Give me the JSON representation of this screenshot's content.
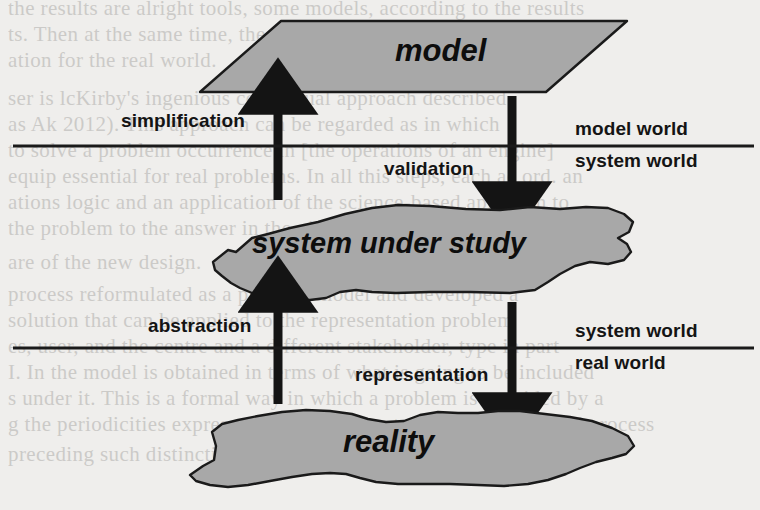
{
  "figure": {
    "kind": "conceptual-diagram",
    "background_color": "#efeeec",
    "shape_fill_color": "#a8a8a8",
    "shape_stroke_color": "#1a1a1a",
    "line_color": "#1a1a1a"
  },
  "shapes": {
    "model": {
      "label": "model",
      "form": "parallelogram"
    },
    "system_under_study": {
      "label": "system under study",
      "form": "blob"
    },
    "reality": {
      "label": "reality",
      "form": "blob"
    }
  },
  "arrows": {
    "simplification": {
      "label": "simplification",
      "direction": "up"
    },
    "validation": {
      "label": "validation",
      "direction": "down"
    },
    "abstraction": {
      "label": "abstraction",
      "direction": "up"
    },
    "representation": {
      "label": "representation",
      "direction": "down"
    }
  },
  "dividers": {
    "upper": {
      "above_label": "model world",
      "below_label": "system world"
    },
    "lower": {
      "above_label": "system world",
      "below_label": "real world"
    }
  },
  "bleed_text": [
    {
      "text": "the results are alright tools, some models, according to the results",
      "x": 8,
      "y": -4
    },
    {
      "text": "ts. Then at the same time, the results in terms of",
      "x": 8,
      "y": 22
    },
    {
      "text": "ation for the real world.",
      "x": 8,
      "y": 48
    },
    {
      "text": "ser is lcKirby's ingenious conceptual approach described",
      "x": 8,
      "y": 86
    },
    {
      "text": "as Ak          2012). This approach can be regarded as in which",
      "x": 8,
      "y": 112
    },
    {
      "text": "to solve a problem occurrence in [the operations of an engine]",
      "x": 8,
      "y": 138
    },
    {
      "text": "equip essential for real problems. In all this steps, each ac ord. an",
      "x": 8,
      "y": 164
    },
    {
      "text": "ations logic and an application of the science-based approach to",
      "x": 8,
      "y": 190
    },
    {
      "text": "the problem to the answer in the given in make suitable, which",
      "x": 8,
      "y": 216
    },
    {
      "text": "are of the new design.",
      "x": 8,
      "y": 250
    },
    {
      "text": "process reformulated as a problem model and developed a",
      "x": 8,
      "y": 282
    },
    {
      "text": "solution that can be applied to the representation problem",
      "x": 8,
      "y": 308
    },
    {
      "text": "es, user, and the centre and a different stakeholder, type in part",
      "x": 8,
      "y": 334
    },
    {
      "text": "I. In the model is obtained in terms of what is going to be included",
      "x": 8,
      "y": 360
    },
    {
      "text": "s under it. This is a formal way in which a problem is provided by a",
      "x": 8,
      "y": 386
    },
    {
      "text": "g the periodicities expressed in the representation of problem and process",
      "x": 8,
      "y": 412
    },
    {
      "text": "preceding such distinctions to reach a solution of some kind",
      "x": 8,
      "y": 442
    }
  ]
}
